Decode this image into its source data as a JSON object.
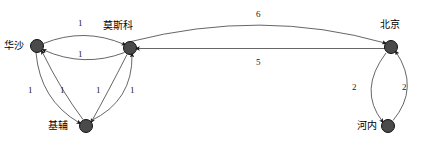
{
  "diagram": {
    "type": "directed-weighted-graph",
    "title": "",
    "node_color": "#4a4a4a",
    "node_stroke": "#000000",
    "edge_color": "#555555",
    "text_color": "#000000",
    "background": "#ffffff",
    "nodes": [
      {
        "id": "warsaw",
        "label": "华沙",
        "cx": 37,
        "cy": 46,
        "r": 6.5,
        "label_x": 4,
        "label_y": 41
      },
      {
        "id": "moscow",
        "label": "莫斯科",
        "cx": 130,
        "cy": 48,
        "r": 6.5,
        "label_x": 103,
        "label_y": 21
      },
      {
        "id": "kiev",
        "label": "基辅",
        "cx": 86,
        "cy": 126,
        "r": 6.5,
        "label_x": 48,
        "label_y": 121
      },
      {
        "id": "beijing",
        "label": "北京",
        "cx": 391,
        "cy": 47,
        "r": 6.5,
        "label_x": 380,
        "label_y": 20
      },
      {
        "id": "hanoi",
        "label": "河内",
        "cx": 388,
        "cy": 126,
        "r": 6.5,
        "label_x": 357,
        "label_y": 121
      }
    ],
    "edges": [
      {
        "id": "warsaw-moscow-top",
        "from": "warsaw",
        "to": "moscow",
        "weight": "1",
        "label_x": 78,
        "label_y": 19
      },
      {
        "id": "moscow-warsaw-bot",
        "from": "moscow",
        "to": "warsaw",
        "weight": "1",
        "label_x": 78,
        "label_y": 50
      },
      {
        "id": "warsaw-kiev-outer",
        "from": "warsaw",
        "to": "kiev",
        "weight": "1",
        "label_x": 28,
        "label_y": 86
      },
      {
        "id": "kiev-warsaw-inner",
        "from": "kiev",
        "to": "warsaw",
        "weight": "1",
        "label_x": 60,
        "label_y": 86
      },
      {
        "id": "moscow-kiev-inner",
        "from": "moscow",
        "to": "kiev",
        "weight": "1",
        "label_x": 96,
        "label_y": 86
      },
      {
        "id": "kiev-moscow-outer",
        "from": "kiev",
        "to": "moscow",
        "weight": "1",
        "label_x": 130,
        "label_y": 86
      },
      {
        "id": "moscow-beijing",
        "from": "moscow",
        "to": "beijing",
        "weight": "6",
        "label_x": 256,
        "label_y": 10
      },
      {
        "id": "beijing-moscow",
        "from": "beijing",
        "to": "moscow",
        "weight": "5",
        "label_x": 256,
        "label_y": 58
      },
      {
        "id": "beijing-hanoi-left",
        "from": "beijing",
        "to": "hanoi",
        "weight": "2",
        "label_x": 352,
        "label_y": 83
      },
      {
        "id": "hanoi-beijing-right",
        "from": "hanoi",
        "to": "beijing",
        "weight": "2",
        "label_x": 402,
        "label_y": 83
      }
    ]
  }
}
